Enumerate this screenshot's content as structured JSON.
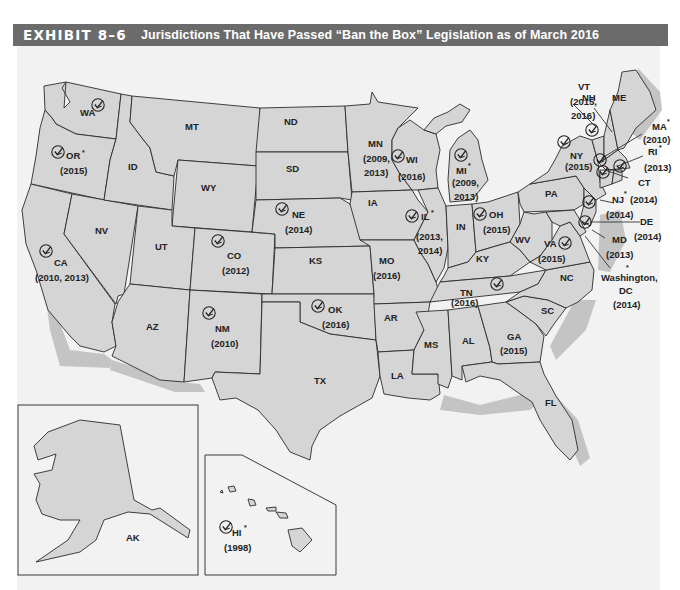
{
  "header": {
    "exhibit": "EXHIBIT 8–6",
    "title": "Jurisdictions That Have Passed “Ban the Box” Legislation as of March 2016"
  },
  "colors": {
    "header_bg": "#6b6b6b",
    "header_text": "#ffffff",
    "panel_bg": "#f2f2f2",
    "state_fill": "#d5d5d5",
    "state_stroke": "#2b2b2b",
    "coast_shadow": "#c4c4c4"
  },
  "legend_icon": "checkmark-in-circle-icon",
  "states": {
    "WA": {
      "label": "WA",
      "years": "",
      "checked": true,
      "asterisk": false
    },
    "OR": {
      "label": "OR",
      "years": "(2015)",
      "checked": true,
      "asterisk": true
    },
    "CA": {
      "label": "CA",
      "years": "(2010, 2013)",
      "checked": true,
      "asterisk": false
    },
    "ID": {
      "label": "ID"
    },
    "NV": {
      "label": "NV"
    },
    "MT": {
      "label": "MT"
    },
    "WY": {
      "label": "WY"
    },
    "UT": {
      "label": "UT"
    },
    "AZ": {
      "label": "AZ"
    },
    "CO": {
      "label": "CO",
      "years": "(2012)",
      "checked": true,
      "asterisk": false
    },
    "NM": {
      "label": "NM",
      "years": "(2010)",
      "checked": true,
      "asterisk": false
    },
    "ND": {
      "label": "ND"
    },
    "SD": {
      "label": "SD"
    },
    "NE": {
      "label": "NE",
      "years": "(2014)",
      "checked": true,
      "asterisk": false
    },
    "KS": {
      "label": "KS"
    },
    "OK": {
      "label": "OK",
      "years": "(2016)",
      "checked": true,
      "asterisk": false
    },
    "TX": {
      "label": "TX"
    },
    "MN": {
      "label": "MN",
      "years_line1": "(2009,",
      "years_line2": "2013)",
      "checked": false,
      "asterisk": false
    },
    "IA": {
      "label": "IA"
    },
    "MO": {
      "label": "MO",
      "years": "(2016)",
      "checked": false,
      "asterisk": false
    },
    "AR": {
      "label": "AR"
    },
    "LA": {
      "label": "LA"
    },
    "WI": {
      "label": "WI",
      "years": "(2016)",
      "checked": true,
      "asterisk": false
    },
    "IL": {
      "label": "IL",
      "years_line1": "(2013,",
      "years_line2": "2014)",
      "checked": true,
      "asterisk": true
    },
    "MI": {
      "label": "MI",
      "years_line1": "(2009,",
      "years_line2": "2013)",
      "checked": true,
      "asterisk": true
    },
    "IN": {
      "label": "IN"
    },
    "OH": {
      "label": "OH",
      "years": "(2015)",
      "checked": true,
      "asterisk": false
    },
    "KY": {
      "label": "KY"
    },
    "TN": {
      "label": "TN",
      "years": "(2016)",
      "checked": false,
      "asterisk": false
    },
    "MS": {
      "label": "MS"
    },
    "AL": {
      "label": "AL"
    },
    "GA": {
      "label": "GA",
      "years": "(2015)",
      "checked": true,
      "asterisk": false
    },
    "FL": {
      "label": "FL"
    },
    "SC": {
      "label": "SC"
    },
    "NC": {
      "label": "NC"
    },
    "VA": {
      "label": "VA",
      "years": "(2015)",
      "checked": true,
      "asterisk": false
    },
    "WV": {
      "label": "WV"
    },
    "PA": {
      "label": "PA"
    },
    "NY": {
      "label": "NY",
      "years": "(2015)",
      "checked": true,
      "asterisk": false
    },
    "VT": {
      "label": "VT",
      "years_line1": "(2015,",
      "years_line2": "2016)",
      "checked": true,
      "asterisk": false
    },
    "NH": {
      "label": "NH"
    },
    "ME": {
      "label": "ME"
    },
    "MA": {
      "label": "MA",
      "years": "(2010)",
      "checked": true,
      "asterisk": true
    },
    "RI": {
      "label": "RI",
      "years": "(2013)",
      "checked": true,
      "asterisk": true
    },
    "CT": {
      "label": "CT",
      "years": "(2010)",
      "checked": true,
      "asterisk": false
    },
    "NJ": {
      "label": "NJ",
      "years": "(2014)",
      "checked": true,
      "asterisk": true
    },
    "DE": {
      "label": "DE",
      "years": "(2014)",
      "checked": true,
      "asterisk": false
    },
    "MD": {
      "label": "MD",
      "years": "(2013)",
      "checked": true,
      "asterisk": false
    },
    "DC": {
      "label_line1": "Washington,",
      "label_line2": "DC",
      "years": "(2014)",
      "checked": true,
      "asterisk": true
    },
    "AK": {
      "label": "AK"
    },
    "HI": {
      "label": "HI",
      "years": "(1998)",
      "checked": true,
      "asterisk": true
    }
  },
  "asterisk": "*"
}
